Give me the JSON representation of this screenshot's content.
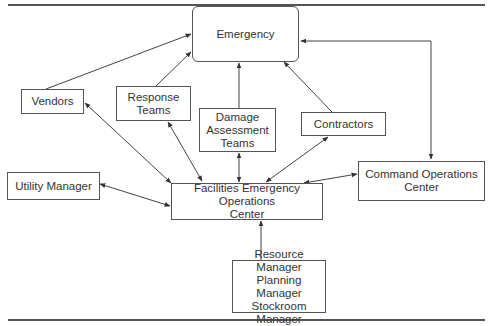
{
  "diagram": {
    "type": "organizational-flow",
    "nodes": [
      {
        "id": "emergency",
        "label": "Emergency"
      },
      {
        "id": "vendors",
        "label": "Vendors"
      },
      {
        "id": "response_teams",
        "label": "Response\nTeams"
      },
      {
        "id": "damage_assessment",
        "label": "Damage\nAssessment\nTeams"
      },
      {
        "id": "contractors",
        "label": "Contractors"
      },
      {
        "id": "command_ops",
        "label": "Command Operations\nCenter"
      },
      {
        "id": "utility_manager",
        "label": "Utility Manager"
      },
      {
        "id": "facilities_eoc",
        "label": "Facilities Emergency Operations\nCenter"
      },
      {
        "id": "managers",
        "label": "Resource Manager\nPlanning Manager\nStockroom Manager"
      }
    ],
    "edges": [
      {
        "from": "vendors",
        "to": "emergency",
        "direction": "one-way"
      },
      {
        "from": "response_teams",
        "to": "emergency",
        "direction": "one-way"
      },
      {
        "from": "damage_assessment",
        "to": "emergency",
        "direction": "one-way"
      },
      {
        "from": "contractors",
        "to": "emergency",
        "direction": "one-way"
      },
      {
        "from": "command_ops",
        "to": "emergency",
        "direction": "two-way"
      },
      {
        "from": "facilities_eoc",
        "to": "vendors",
        "direction": "two-way"
      },
      {
        "from": "facilities_eoc",
        "to": "response_teams",
        "direction": "two-way"
      },
      {
        "from": "facilities_eoc",
        "to": "damage_assessment",
        "direction": "two-way"
      },
      {
        "from": "facilities_eoc",
        "to": "contractors",
        "direction": "two-way"
      },
      {
        "from": "facilities_eoc",
        "to": "command_ops",
        "direction": "two-way"
      },
      {
        "from": "facilities_eoc",
        "to": "utility_manager",
        "direction": "two-way"
      },
      {
        "from": "managers",
        "to": "facilities_eoc",
        "direction": "one-way"
      }
    ]
  },
  "labels": {
    "emergency": "Emergency",
    "vendors": "Vendors",
    "response_teams": "Response\nTeams",
    "damage_assessment": "Damage\nAssessment\nTeams",
    "contractors": "Contractors",
    "command_ops": "Command Operations\nCenter",
    "utility_manager": "Utility Manager",
    "facilities_eoc": "Facilities Emergency Operations\nCenter",
    "managers": "Resource Manager\nPlanning Manager\nStockroom Manager"
  },
  "colors": {
    "line": "#444444",
    "box_border": "#555555",
    "text": "#333333"
  }
}
